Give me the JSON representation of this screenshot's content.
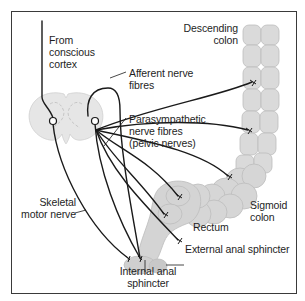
{
  "figure": {
    "colors": {
      "frame": "#3a3a3a",
      "nerve": "#1a1a1a",
      "tissue_fill": "#d9d9d9",
      "tissue_stroke": "#bdbdbd",
      "cord_fill": "#e6e6e6",
      "text": "#1e1e1e"
    }
  },
  "labels": {
    "from_cortex": "From\nconscious\ncortex",
    "afferent": "Afferent nerve\nfibres",
    "parasympathetic": "Parasympathetic\nnerve fibres\n(pelvic nerves)",
    "descending_colon": "Descending\ncolon",
    "skeletal_motor": "Skeletal\nmotor nerve",
    "sigmoid_colon": "Sigmoid\ncolon",
    "rectum": "Rectum",
    "external_sphincter": "External anal sphincter",
    "internal_sphincter": "Internal anal\nsphincter"
  }
}
